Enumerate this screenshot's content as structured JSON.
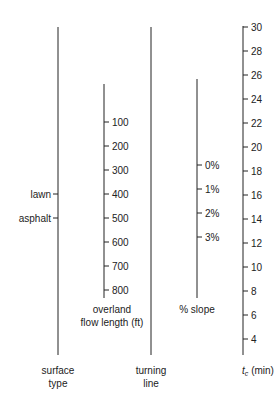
{
  "colors": {
    "line": "#222222",
    "background": "#ffffff"
  },
  "axes": {
    "surface_type": {
      "label_line1": "surface",
      "label_line2": "type",
      "ticks": [
        {
          "label": "lawn",
          "y": 194
        },
        {
          "label": "asphalt",
          "y": 218
        }
      ]
    },
    "overland_flow": {
      "label_line1": "overland",
      "label_line2": "flow length (ft)",
      "ticks": [
        {
          "label": "100",
          "y": 122
        },
        {
          "label": "200",
          "y": 146
        },
        {
          "label": "300",
          "y": 170
        },
        {
          "label": "400",
          "y": 194
        },
        {
          "label": "500",
          "y": 218
        },
        {
          "label": "600",
          "y": 242
        },
        {
          "label": "700",
          "y": 266
        },
        {
          "label": "800",
          "y": 290
        }
      ]
    },
    "turning_line": {
      "label_line1": "turning",
      "label_line2": "line"
    },
    "slope": {
      "label": "% slope",
      "ticks": [
        {
          "label": "0%",
          "y": 165
        },
        {
          "label": "1%",
          "y": 189
        },
        {
          "label": "2%",
          "y": 213
        },
        {
          "label": "3%",
          "y": 237
        }
      ]
    },
    "tc": {
      "label_var": "t",
      "label_sub": "c",
      "label_unit": " (min)",
      "ticks": [
        {
          "label": "30",
          "y": 27
        },
        {
          "label": "28",
          "y": 51
        },
        {
          "label": "26",
          "y": 75
        },
        {
          "label": "24",
          "y": 99
        },
        {
          "label": "22",
          "y": 123
        },
        {
          "label": "20",
          "y": 147
        },
        {
          "label": "18",
          "y": 171
        },
        {
          "label": "16",
          "y": 195
        },
        {
          "label": "14",
          "y": 219
        },
        {
          "label": "12",
          "y": 243
        },
        {
          "label": "10",
          "y": 267
        },
        {
          "label": "8",
          "y": 291
        },
        {
          "label": "6",
          "y": 315
        },
        {
          "label": "4",
          "y": 339
        }
      ]
    }
  }
}
